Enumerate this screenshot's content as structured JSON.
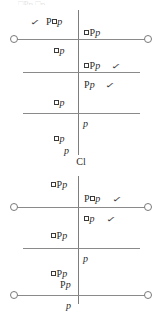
{
  "page": {
    "kind": "modal-logic-tableau-figure",
    "width": 162,
    "height": 319,
    "background": "#ffffff",
    "ink_color": "#2b2b2b",
    "line_color": "#8a8a8a"
  },
  "artifacts": {
    "top_smudge_text": "□Pp □p"
  },
  "diagrams": [
    {
      "id": "diagram-1",
      "caption": "Cl",
      "axis": {
        "left_node_label": "",
        "right_node_label": ""
      },
      "entries": [
        {
          "id": "d1-e1",
          "side": "left",
          "text": "P□p",
          "check": true
        },
        {
          "id": "d1-e2",
          "side": "right",
          "text": "□Pp",
          "check": false
        },
        {
          "id": "d1-e3",
          "side": "left",
          "text": "□p",
          "check": false
        },
        {
          "id": "d1-e4",
          "side": "right",
          "text": "□Pp",
          "check": true
        },
        {
          "id": "d1-e5",
          "side": "right",
          "text": "Pp",
          "check": true
        },
        {
          "id": "d1-e6",
          "side": "left",
          "text": "□p",
          "check": false
        },
        {
          "id": "d1-e7",
          "side": "right",
          "text": "p",
          "check": false
        },
        {
          "id": "d1-e8",
          "side": "left",
          "text": "□p",
          "check": false
        },
        {
          "id": "d1-e9",
          "side": "left",
          "text": "p",
          "check": false
        }
      ]
    },
    {
      "id": "diagram-2",
      "caption": "",
      "axis": {
        "left_node_label": "",
        "right_node_label": ""
      },
      "entries": [
        {
          "id": "d2-e1",
          "side": "left",
          "text": "□Pp",
          "check": false
        },
        {
          "id": "d2-e2",
          "side": "right",
          "text": "P□p",
          "check": true
        },
        {
          "id": "d2-e3",
          "side": "right",
          "text": "□p",
          "check": true
        },
        {
          "id": "d2-e4",
          "side": "left",
          "text": "□Pp",
          "check": false
        },
        {
          "id": "d2-e5",
          "side": "right",
          "text": "p",
          "check": false
        },
        {
          "id": "d2-e6",
          "side": "left",
          "text": "□Pp",
          "check": false
        },
        {
          "id": "d2-e7",
          "side": "left",
          "text": "Pp",
          "check": false
        },
        {
          "id": "d2-e8",
          "side": "left",
          "text": "Pp",
          "check": false
        },
        {
          "id": "d2-e9",
          "side": "left",
          "text": "p",
          "check": false
        }
      ]
    }
  ],
  "symbols": {
    "check_glyph": "✓",
    "box_glyph": "□"
  }
}
